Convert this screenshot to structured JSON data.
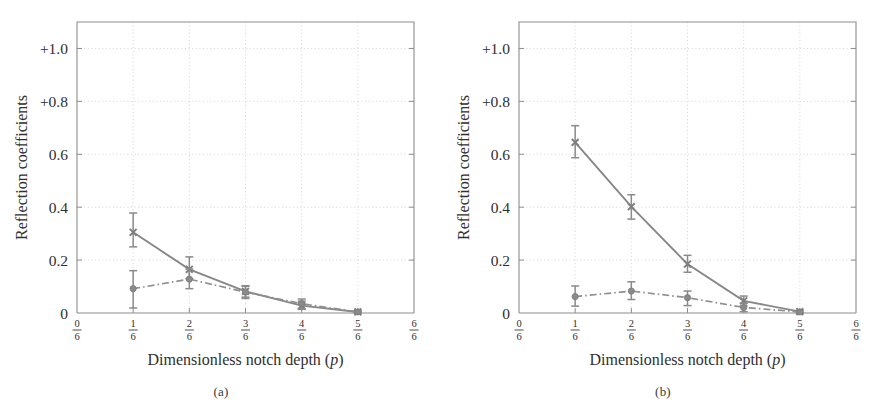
{
  "figure": {
    "panels": [
      {
        "caption": "(a)",
        "xlabel": "Dimensionless notch depth (p)",
        "xlabel_main": "Dimensionless notch depth",
        "xlabel_sym": "(p)",
        "ylabel": "Reflection coefficients"
      },
      {
        "caption": "(b)",
        "xlabel": "Dimensionless notch depth (p)",
        "xlabel_main": "Dimensionless notch depth",
        "xlabel_sym": "(p)",
        "ylabel": "Reflection coefficients"
      }
    ]
  },
  "axes": {
    "ytick_labels": [
      "+1.0",
      "+0.8",
      "0.6",
      "0.4",
      "0.2",
      "0"
    ],
    "ytick_values": [
      1.0,
      0.8,
      0.6,
      0.4,
      0.2,
      0.0
    ],
    "ylim": [
      0.0,
      1.1
    ],
    "xtick_labels": [
      "0/6",
      "1/6",
      "2/6",
      "3/6",
      "4/6",
      "5/6",
      "6/6"
    ],
    "xtick_numerators": [
      "0",
      "1",
      "2",
      "3",
      "4",
      "5",
      "6"
    ],
    "xtick_denominator": "6",
    "xtick_values": [
      0,
      0.16667,
      0.33333,
      0.5,
      0.66667,
      0.83333,
      1.0
    ],
    "xlim": [
      0,
      1.0
    ],
    "grid": true,
    "grid_style": "dotted",
    "legend": "none"
  },
  "colors": {
    "line_solid": "#878787",
    "line_dashdot": "#8f8f8f",
    "marker": "#8a8a8a",
    "axis": "#8d8d8d",
    "grid": "#c9c9c9",
    "text": "#2f2f2f",
    "background": "#ffffff"
  },
  "chart_data": [
    {
      "type": "line",
      "title": "(a)",
      "xlabel": "Dimensionless notch depth (p)",
      "ylabel": "Reflection coefficients",
      "xlim": [
        0,
        1.0
      ],
      "ylim": [
        0,
        1.1
      ],
      "grid": true,
      "legend_position": "none",
      "x": [
        0.16667,
        0.33333,
        0.5,
        0.66667,
        0.83333
      ],
      "x_labels": [
        "1/6",
        "2/6",
        "3/6",
        "4/6",
        "5/6"
      ],
      "series": [
        {
          "name": "solid-line-series",
          "style": "solid",
          "marker": "cross",
          "values": [
            0.305,
            0.165,
            0.082,
            0.028,
            0.004
          ],
          "errors_low": [
            0.055,
            0.035,
            0.022,
            0.014,
            0.004
          ],
          "errors_high": [
            0.073,
            0.047,
            0.021,
            0.017,
            0.004
          ]
        },
        {
          "name": "dash-dot-series",
          "style": "dash-dot",
          "marker": "circle",
          "values": [
            0.092,
            0.128,
            0.079,
            0.035,
            0.004
          ],
          "errors_low": [
            0.073,
            0.036,
            0.024,
            0.019,
            0.004
          ],
          "errors_high": [
            0.068,
            0.038,
            0.022,
            0.018,
            0.004
          ]
        }
      ]
    },
    {
      "type": "line",
      "title": "(b)",
      "xlabel": "Dimensionless notch depth (p)",
      "ylabel": "Reflection coefficients",
      "xlim": [
        0,
        1.0
      ],
      "ylim": [
        0,
        1.1
      ],
      "grid": true,
      "legend_position": "none",
      "x": [
        0.16667,
        0.33333,
        0.5,
        0.66667,
        0.83333
      ],
      "x_labels": [
        "1/6",
        "2/6",
        "3/6",
        "4/6",
        "5/6"
      ],
      "series": [
        {
          "name": "solid-line-series",
          "style": "solid",
          "marker": "cross",
          "values": [
            0.645,
            0.402,
            0.185,
            0.046,
            0.005
          ],
          "errors_low": [
            0.058,
            0.047,
            0.031,
            0.019,
            0.005
          ],
          "errors_high": [
            0.063,
            0.045,
            0.033,
            0.018,
            0.005
          ]
        },
        {
          "name": "dash-dot-series",
          "style": "dash-dot",
          "marker": "circle",
          "values": [
            0.062,
            0.083,
            0.058,
            0.021,
            0.004
          ],
          "errors_low": [
            0.036,
            0.032,
            0.03,
            0.016,
            0.004
          ],
          "errors_high": [
            0.04,
            0.035,
            0.025,
            0.016,
            0.004
          ]
        }
      ]
    }
  ]
}
